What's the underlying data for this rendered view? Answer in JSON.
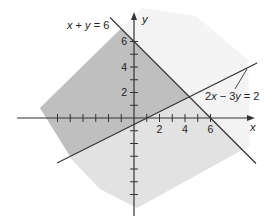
{
  "chart_data": {
    "type": "line",
    "title": "",
    "xlabel": "x",
    "ylabel": "y",
    "xlim": [
      -9.18,
      9.49
    ],
    "ylim": [
      -7.69,
      8.31
    ],
    "grid": false,
    "legend": "none (lines labeled directly)",
    "axis_color": "#333333",
    "x_ticks": [
      -6,
      -5,
      -4,
      -3,
      -2,
      -1,
      1,
      2,
      3,
      4,
      5,
      6
    ],
    "y_ticks": [
      -6,
      -5,
      -4,
      -3,
      -2,
      -1,
      1,
      2,
      3,
      4,
      5,
      6
    ],
    "x_tick_labels": [
      {
        "value": 2,
        "text": "2"
      },
      {
        "value": 4,
        "text": "4"
      },
      {
        "value": 6,
        "text": "6"
      }
    ],
    "y_tick_labels": [
      {
        "value": 2,
        "text": "2"
      },
      {
        "value": 4,
        "text": "4"
      },
      {
        "value": 6,
        "text": "6"
      }
    ],
    "xlabel_pos": [
      9.1,
      -1.02
    ],
    "ylabel_pos": [
      0.63,
      7.45
    ],
    "series": [
      {
        "name": "x + y = 6",
        "equation": "x + y = 6",
        "x": [
          -1.88,
          9.57
        ],
        "y": [
          7.88,
          -3.57
        ],
        "color": "#333333",
        "label_pos": [
          -5.25,
          6.98
        ]
      },
      {
        "name": "2x − 3y = 2",
        "equation": "2x − 3y = 2",
        "x": [
          -6.04,
          9.65
        ],
        "y": [
          -3.53,
          4.31
        ],
        "color": "#333333",
        "label_pos": [
          5.57,
          1.41
        ],
        "leader": {
          "x": [
            8.86,
            7.92
          ],
          "y": [
            3.84,
            2.27
          ]
        }
      }
    ],
    "regions": [
      {
        "name": "unshaded plane",
        "fill": "#f4f4f4",
        "bounded_by": [],
        "contains": [
          0,
          0
        ]
      },
      {
        "name": "x + y ≤ 6",
        "fill": "#e2e2e2",
        "bounded_by": [
          0
        ],
        "contains": [
          0,
          0
        ]
      },
      {
        "name": "x + y ≤ 6 and 2x − 3y ≤ 2",
        "fill": "#bfbfbf",
        "bounded_by": [
          0,
          1
        ],
        "contains": [
          0,
          0
        ]
      }
    ],
    "intersection": {
      "x": 4,
      "y": 2
    }
  }
}
